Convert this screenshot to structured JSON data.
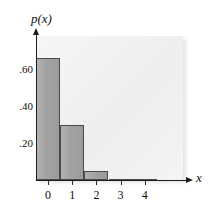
{
  "chart_data": {
    "type": "bar",
    "title": "",
    "subtitle": "",
    "xlabel": "x",
    "ylabel": "p(x)",
    "categories": [
      "0",
      "1",
      "2",
      "3",
      "4"
    ],
    "values": [
      0.66,
      0.3,
      0.05,
      0.008,
      0.002
    ],
    "x": [
      0,
      1,
      2,
      3,
      4
    ],
    "series": [
      {
        "name": "p(x)",
        "values": [
          0.66,
          0.3,
          0.05,
          0.008,
          0.002
        ]
      }
    ],
    "xlim": [
      -0.5,
      4.8
    ],
    "ylim": [
      0,
      0.74
    ],
    "x_tick_labels": [
      "0",
      "1",
      "2",
      "3",
      "4"
    ],
    "y_tick_labels": [
      ".60",
      ".40",
      ".20"
    ],
    "y_tick_values": [
      0.6,
      0.4,
      0.2
    ],
    "grid": false,
    "legend": false,
    "legend_position": "none",
    "annotations": [],
    "colors": {
      "bar_fill": "#a2a2a2",
      "bar_edge": "#4a4a4a",
      "panel": "#f2f2f1",
      "axis": "#1c1c1c",
      "text": "#111111"
    }
  },
  "axes": {
    "y_title": "p(x)",
    "x_title": "x",
    "y_ticks": [
      {
        "label": ".60",
        "value": 0.6
      },
      {
        "label": ".40",
        "value": 0.4
      },
      {
        "label": ".20",
        "value": 0.2
      }
    ],
    "x_ticks": [
      {
        "label": "0",
        "value": 0
      },
      {
        "label": "1",
        "value": 1
      },
      {
        "label": "2",
        "value": 2
      },
      {
        "label": "3",
        "value": 3
      },
      {
        "label": "4",
        "value": 4
      }
    ]
  }
}
